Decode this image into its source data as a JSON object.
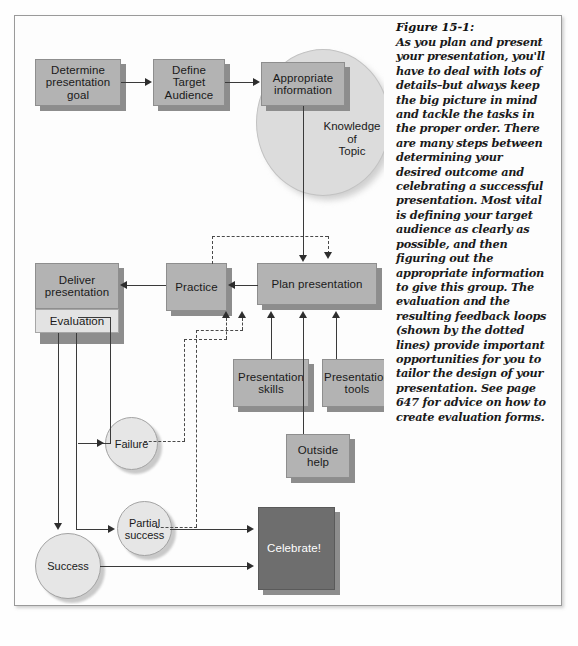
{
  "figure": {
    "caption_title": "Figure 15-1:",
    "caption_body": "As you plan and present your presentation, you'll have to deal with lots of details–but always keep the big picture in mind and tackle the tasks in the proper order. There are many steps between determining your desired outcome and celebrating a successful presentation. Most vital is defining your target audience as clearly as possible, and then figuring out the appropriate information to give this group. The evaluation and the resulting feedback loops (shown by the dotted lines) provide important opportunities for you to tailor the design of your presentation. See page 647 for advice on how to create evaluation forms."
  },
  "colors": {
    "box_fill": "#b3b3b3",
    "box_light_fill": "#e3e3e3",
    "box_dark_fill": "#6e6e6e",
    "circle_fill": "#e6e6e6",
    "big_circle_fill": "#dcdcdc",
    "line": "#3a3a3a",
    "page_background": "#ffffff"
  },
  "diagram": {
    "type": "flowchart",
    "nodes": [
      {
        "id": "determine-goal",
        "shape": "box",
        "label": "Determine\npresentation\ngoal"
      },
      {
        "id": "define-audience",
        "shape": "box",
        "label": "Define\nTarget\nAudience"
      },
      {
        "id": "appropriate-info",
        "shape": "box",
        "label": "Appropriate\ninformation"
      },
      {
        "id": "knowledge-of-topic",
        "shape": "circle-big",
        "label": "Knowledge\nof\nTopic"
      },
      {
        "id": "plan-presentation",
        "shape": "box",
        "label": "Plan presentation"
      },
      {
        "id": "practice",
        "shape": "box",
        "label": "Practice"
      },
      {
        "id": "deliver-presentation",
        "shape": "box",
        "label": "Deliver\npresentation"
      },
      {
        "id": "evaluation",
        "shape": "box-light",
        "label": "Evaluation"
      },
      {
        "id": "presentation-skills",
        "shape": "box",
        "label": "Presentation\nskills"
      },
      {
        "id": "presentation-tools",
        "shape": "box",
        "label": "Presentation\ntools"
      },
      {
        "id": "outside-help",
        "shape": "box",
        "label": "Outside\nhelp"
      },
      {
        "id": "failure",
        "shape": "circle",
        "label": "Failure"
      },
      {
        "id": "partial-success",
        "shape": "circle",
        "label": "Partial\nsuccess"
      },
      {
        "id": "success",
        "shape": "circle",
        "label": "Success"
      },
      {
        "id": "celebrate",
        "shape": "box-dark",
        "label": "Celebrate!"
      }
    ],
    "edges": [
      {
        "from": "determine-goal",
        "to": "define-audience",
        "style": "solid"
      },
      {
        "from": "define-audience",
        "to": "appropriate-info",
        "style": "solid"
      },
      {
        "from": "appropriate-info",
        "to": "plan-presentation",
        "style": "solid"
      },
      {
        "from": "plan-presentation",
        "to": "practice",
        "style": "solid"
      },
      {
        "from": "practice",
        "to": "deliver-presentation",
        "style": "solid"
      },
      {
        "from": "practice",
        "to": "plan-presentation",
        "style": "dashed"
      },
      {
        "from": "presentation-skills",
        "to": "plan-presentation",
        "style": "solid"
      },
      {
        "from": "presentation-tools",
        "to": "plan-presentation",
        "style": "solid"
      },
      {
        "from": "outside-help",
        "to": "plan-presentation",
        "style": "solid"
      },
      {
        "from": "evaluation",
        "to": "failure",
        "style": "solid"
      },
      {
        "from": "evaluation",
        "to": "partial-success",
        "style": "solid"
      },
      {
        "from": "evaluation",
        "to": "success",
        "style": "solid"
      },
      {
        "from": "failure",
        "to": "plan-presentation",
        "style": "dashed"
      },
      {
        "from": "partial-success",
        "to": "plan-presentation",
        "style": "dashed"
      },
      {
        "from": "partial-success",
        "to": "celebrate",
        "style": "solid"
      },
      {
        "from": "success",
        "to": "celebrate",
        "style": "solid"
      }
    ],
    "labels": {
      "determine_goal_l1": "Determine",
      "determine_goal_l2": "presentation",
      "determine_goal_l3": "goal",
      "define_audience_l1": "Define",
      "define_audience_l2": "Target",
      "define_audience_l3": "Audience",
      "appropriate_info_l1": "Appropriate",
      "appropriate_info_l2": "information",
      "knowledge_l1": "Knowledge",
      "knowledge_l2": "of",
      "knowledge_l3": "Topic",
      "plan_presentation": "Plan presentation",
      "practice": "Practice",
      "deliver_l1": "Deliver",
      "deliver_l2": "presentation",
      "evaluation": "Evaluation",
      "skills_l1": "Presentation",
      "skills_l2": "skills",
      "tools_l1": "Presentation",
      "tools_l2": "tools",
      "outside_l1": "Outside",
      "outside_l2": "help",
      "failure": "Failure",
      "partial_l1": "Partial",
      "partial_l2": "success",
      "success": "Success",
      "celebrate": "Celebrate!"
    }
  }
}
